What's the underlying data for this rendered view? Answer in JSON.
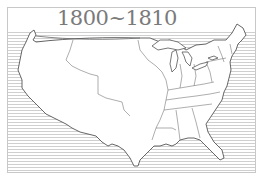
{
  "map": {
    "title": "1800~1810",
    "subject": "United States outline map with state boundaries",
    "style": "line-art",
    "water_pattern": "horizontal-hatching",
    "colors": {
      "background": "#ffffff",
      "land": "#ffffff",
      "outline": "#555555",
      "hatch": "#cfcfcf",
      "title": "#7a7a7a",
      "frame": "#c8c8c8"
    }
  }
}
